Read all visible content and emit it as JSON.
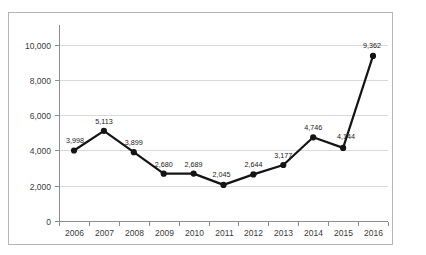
{
  "chart_data": {
    "type": "line",
    "title": "",
    "subtitle": "",
    "xlabel": "",
    "ylabel": "",
    "categories": [
      "2006",
      "2007",
      "2008",
      "2009",
      "2010",
      "2011",
      "2012",
      "2013",
      "2014",
      "2015",
      "2016"
    ],
    "values": [
      3998,
      5113,
      3899,
      2680,
      2689,
      2045,
      2644,
      3177,
      4746,
      4144,
      9362
    ],
    "data_labels": [
      "3,998",
      "5,113",
      "3,899",
      "2,680",
      "2,689",
      "2,045",
      "2,644",
      "3,177",
      "4,746",
      "4,144",
      "9,362"
    ],
    "ylim": [
      0,
      11000
    ],
    "yticks": [
      0,
      2000,
      4000,
      6000,
      8000,
      10000
    ],
    "ytick_labels": [
      "0",
      "2,000",
      "4,000",
      "6,000",
      "8,000",
      "10,000"
    ],
    "xtick_labels": [
      "2006",
      "2007",
      "2008",
      "2009",
      "2010",
      "2011",
      "2012",
      "2013",
      "2014",
      "2015",
      "2016"
    ],
    "grid": true,
    "grid_axis": "y",
    "legend": false,
    "legend_position": "none",
    "series": [
      {
        "name": "",
        "values": [
          3998,
          5113,
          3899,
          2680,
          2689,
          2045,
          2644,
          3177,
          4746,
          4144,
          9362
        ],
        "color": "#141414",
        "marker": "circle",
        "show_labels": true
      }
    ],
    "colors": {
      "line": "#141414",
      "marker": "#141414",
      "grid": "#d9d9d9",
      "axis": "#8d8d8d",
      "border": "#b5b5b5",
      "background": "#ffffff",
      "tick_text": "#3a3a3a",
      "label_text": "#1a1a1a"
    }
  }
}
